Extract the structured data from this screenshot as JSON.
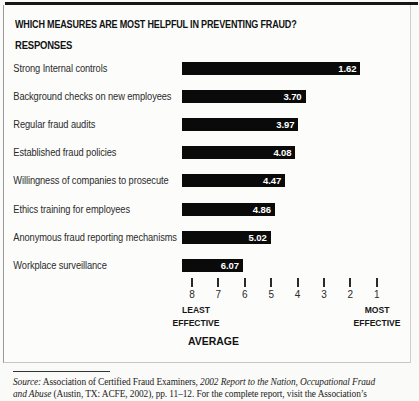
{
  "title": "WHICH MEASURES ARE MOST HELPFUL IN PREVENTING FRAUD?",
  "subtitle": "RESPONSES",
  "chart_data": {
    "type": "bar",
    "orientation": "horizontal",
    "title": "WHICH MEASURES ARE MOST HELPFUL IN PREVENTING FRAUD?",
    "subtitle": "RESPONSES",
    "categories": [
      "Strong Internal controls",
      "Background checks on new employees",
      "Regular fraud audits",
      "Established fraud policies",
      "Willingness of companies to prosecute",
      "Ethics training for employees",
      "Anonymous fraud reporting mechanisms",
      "Workplace surveillance"
    ],
    "values": [
      1.62,
      3.7,
      3.97,
      4.08,
      4.47,
      4.86,
      5.02,
      6.07
    ],
    "value_labels": [
      "1.62",
      "3.70",
      "3.97",
      "4.08",
      "4.47",
      "4.86",
      "5.02",
      "6.07"
    ],
    "axis_ticks": [
      "8",
      "7",
      "6",
      "5",
      "4",
      "3",
      "2",
      "1"
    ],
    "axis_range": [
      8,
      1
    ],
    "axis_reversed": true,
    "xlabel": "AVERAGE",
    "axis_labels": {
      "left": [
        "LEAST",
        "EFFECTIVE"
      ],
      "right": [
        "MOST",
        "EFFECTIVE"
      ]
    },
    "legend": "none",
    "grid": "off",
    "bar_color": "#0a0a0a",
    "value_label_color": "#ffffff"
  },
  "footer": {
    "source_label": "Source:",
    "source_text_1": "Association of Certified Fraud Examiners,",
    "source_title_line1": "2002 Report to the Nation, Occupational Fraud",
    "source_title_line2": "and Abuse",
    "source_text_2": "(Austin, TX: ACFE, 2002), pp. 11–12. For the complete report, visit the Association’s"
  }
}
